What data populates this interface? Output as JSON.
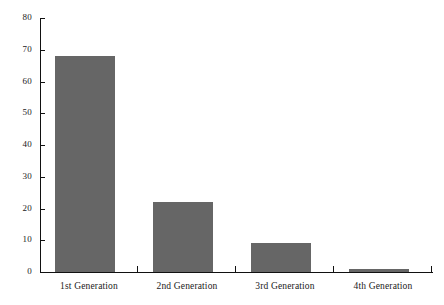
{
  "chart_data": {
    "type": "bar",
    "title": "",
    "subtitle": "",
    "xlabel": "",
    "ylabel": "",
    "categories": [
      "1st Generation",
      "2nd Generation",
      "3rd Generation",
      "4th Generation"
    ],
    "values": [
      68,
      22,
      9,
      1
    ],
    "ylim": [
      0,
      80
    ],
    "ytick_labels": [
      "0",
      "10",
      "20",
      "30",
      "40",
      "50",
      "60",
      "70",
      "80"
    ],
    "ytick_values": [
      0,
      10,
      20,
      30,
      40,
      50,
      60,
      70,
      80
    ],
    "grid": false,
    "legend": false,
    "legend_position": "none",
    "annotations": [],
    "series": [
      {
        "name": "",
        "values": [
          68,
          22,
          9,
          1
        ]
      }
    ],
    "bar_color": "#666666",
    "axis_color": "#111111",
    "background_color": "#ffffff"
  }
}
